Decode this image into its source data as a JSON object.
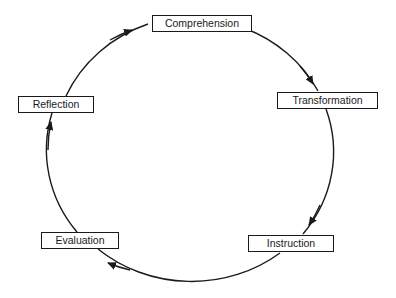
{
  "diagram": {
    "type": "cycle",
    "direction": "clockwise",
    "stroke_color": "#1a1a1a",
    "background_color": "#ffffff",
    "nodes": [
      {
        "id": "comprehension",
        "label": "Comprehension"
      },
      {
        "id": "transformation",
        "label": "Transformation"
      },
      {
        "id": "instruction",
        "label": "Instruction"
      },
      {
        "id": "evaluation",
        "label": "Evaluation"
      },
      {
        "id": "reflection",
        "label": "Reflection"
      }
    ],
    "edges": [
      {
        "from": "comprehension",
        "to": "transformation"
      },
      {
        "from": "transformation",
        "to": "instruction"
      },
      {
        "from": "instruction",
        "to": "evaluation"
      },
      {
        "from": "evaluation",
        "to": "reflection"
      },
      {
        "from": "reflection",
        "to": "comprehension"
      }
    ]
  }
}
